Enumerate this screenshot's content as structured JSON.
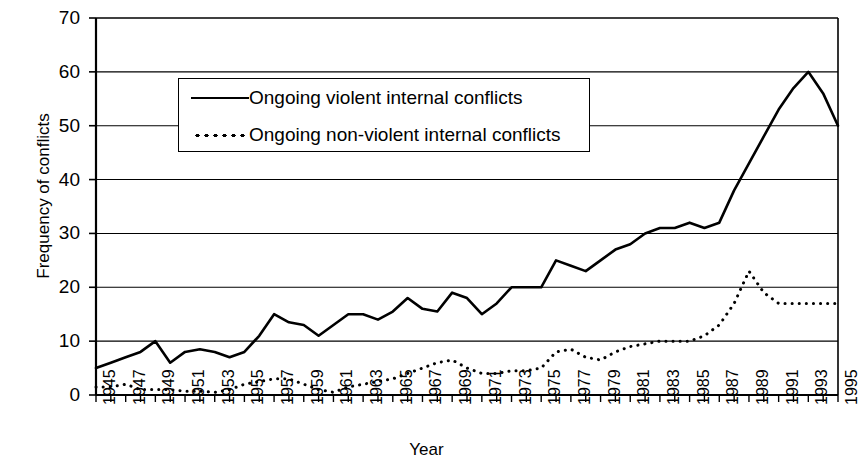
{
  "chart_data": {
    "type": "line",
    "title": "",
    "xlabel": "Year",
    "ylabel": "Frequency of conflicts",
    "xlim": [
      1945,
      1995
    ],
    "ylim": [
      0,
      70
    ],
    "ytick_values": [
      0,
      10,
      20,
      30,
      40,
      50,
      60,
      70
    ],
    "ytick_labels": [
      "0",
      "10",
      "20",
      "30",
      "40",
      "50",
      "60",
      "70"
    ],
    "xtick_labels": [
      "1945",
      "1947",
      "1949",
      "1951",
      "1953",
      "1955",
      "1957",
      "1959",
      "1961",
      "1963",
      "1965",
      "1967",
      "1969",
      "1971",
      "1973",
      "1975",
      "1977",
      "1979",
      "1981",
      "1983",
      "1985",
      "1987",
      "1989",
      "1991",
      "1993",
      "1995"
    ],
    "xtick_values": [
      1945,
      1947,
      1949,
      1951,
      1953,
      1955,
      1957,
      1959,
      1961,
      1963,
      1965,
      1967,
      1969,
      1971,
      1973,
      1975,
      1977,
      1979,
      1981,
      1983,
      1985,
      1987,
      1989,
      1991,
      1993,
      1995
    ],
    "grid": "horizontal",
    "legend_position": "upper-left-inside",
    "x": [
      1945,
      1946,
      1947,
      1948,
      1949,
      1950,
      1951,
      1952,
      1953,
      1954,
      1955,
      1956,
      1957,
      1958,
      1959,
      1960,
      1961,
      1962,
      1963,
      1964,
      1965,
      1966,
      1967,
      1968,
      1969,
      1970,
      1971,
      1972,
      1973,
      1974,
      1975,
      1976,
      1977,
      1978,
      1979,
      1980,
      1981,
      1982,
      1983,
      1984,
      1985,
      1986,
      1987,
      1988,
      1989,
      1990,
      1991,
      1992,
      1993,
      1994,
      1995
    ],
    "series": [
      {
        "name": "Ongoing violent internal conflicts",
        "style": "solid",
        "color": "#000000",
        "values": [
          5,
          6,
          7,
          8,
          10,
          6,
          8,
          8.5,
          8,
          7,
          8,
          11,
          15,
          13.5,
          13,
          11,
          13,
          15,
          15,
          14,
          15.5,
          18,
          16,
          15.5,
          19,
          18,
          15,
          17,
          20,
          20,
          20,
          25,
          24,
          23,
          25,
          27,
          28,
          30,
          31,
          31,
          32,
          31,
          32,
          38,
          43,
          48,
          53,
          57,
          60,
          56,
          50
        ]
      },
      {
        "name": "Ongoing non-violent internal conflicts",
        "style": "dotted",
        "color": "#000000",
        "values": [
          1.5,
          1.5,
          2,
          1,
          1,
          1,
          0.7,
          0.7,
          0.5,
          1,
          2,
          2.5,
          3,
          3,
          2,
          1,
          0.5,
          1.5,
          2,
          2.5,
          3,
          4,
          5,
          6,
          6.5,
          5,
          4,
          4,
          4.5,
          4.5,
          5,
          8,
          8.5,
          7,
          6.5,
          8,
          9,
          9.5,
          10,
          10,
          10,
          11,
          13,
          17,
          23,
          19,
          17,
          17,
          17,
          17,
          17
        ]
      }
    ]
  }
}
